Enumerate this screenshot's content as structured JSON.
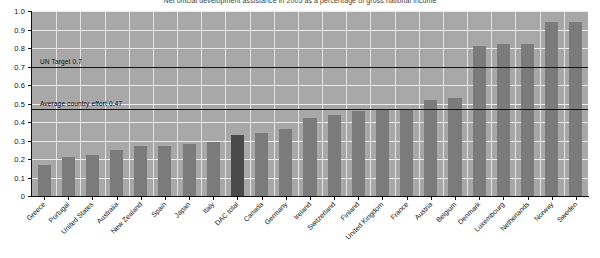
{
  "chart_data": {
    "type": "bar",
    "title": "Net official development assistance in 2005 as a percentage of gross national income",
    "xlabel": "",
    "ylabel": "",
    "ylim": [
      0,
      1.0
    ],
    "ytick_labels": [
      "0",
      "0.1",
      "0.2",
      "0.3",
      "0.4",
      "0.5",
      "0.6",
      "0.7",
      "0.8",
      "0.9",
      "1.0"
    ],
    "ytick_values": [
      0,
      0.1,
      0.2,
      0.3,
      0.4,
      0.5,
      0.6,
      0.7,
      0.8,
      0.9,
      1.0
    ],
    "grid": true,
    "legend": "none",
    "categories": [
      "Greece",
      "Portugal",
      "United States",
      "Australia",
      "New Zealand",
      "Spain",
      "Japan",
      "Italy",
      "DAC total",
      "Canada",
      "Germany",
      "Ireland",
      "Switzerland",
      "Finland",
      "United Kingdom",
      "France",
      "Austria",
      "Belgium",
      "Denmark",
      "Luxembourg",
      "Netherlands",
      "Norway",
      "Sweden"
    ],
    "values": [
      0.17,
      0.21,
      0.22,
      0.25,
      0.27,
      0.27,
      0.28,
      0.29,
      0.33,
      0.34,
      0.36,
      0.42,
      0.44,
      0.46,
      0.47,
      0.47,
      0.52,
      0.53,
      0.81,
      0.82,
      0.82,
      0.94,
      0.94
    ],
    "highlight_category": "DAC total",
    "bar_color": "#7b7b7b",
    "highlight_color": "#4a4a4a",
    "plot_background": "#a8a8a8",
    "gridline_color": "#ededed",
    "annotations": [
      {
        "label": "UN Target 0.7",
        "value": 0.7
      },
      {
        "label": "Average country effort 0.47",
        "value": 0.47
      }
    ]
  }
}
